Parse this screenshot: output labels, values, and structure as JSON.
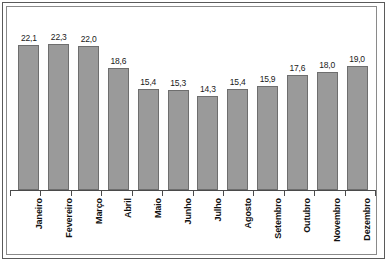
{
  "chart_data": {
    "type": "bar",
    "title": "",
    "subtitle": "",
    "xlabel": "",
    "ylabel": "",
    "grid": false,
    "legend": false,
    "ylim": [
      0,
      24
    ],
    "categories": [
      "Janeiro",
      "Fevereiro",
      "Março",
      "Abril",
      "Maio",
      "Junho",
      "Julho",
      "Agosto",
      "Setembro",
      "Outubro",
      "Novembro",
      "Dezembro"
    ],
    "values": [
      22.1,
      22.3,
      22.0,
      18.6,
      15.4,
      15.3,
      14.3,
      15.4,
      15.9,
      17.6,
      18.0,
      19.0
    ],
    "value_labels": [
      "22,1",
      "22,3",
      "22,0",
      "18,6",
      "15,4",
      "15,3",
      "14,3",
      "15,4",
      "15,9",
      "17,6",
      "18,0",
      "19,0"
    ],
    "decimal_separator": ",",
    "bar_color": "#9a9a9a",
    "bar_border_color": "#6e6e6e",
    "background_color": "#ffffff",
    "frame_color": "#5a5a5a",
    "axis_color": "#4a4a4a",
    "label_rotation": -90
  }
}
